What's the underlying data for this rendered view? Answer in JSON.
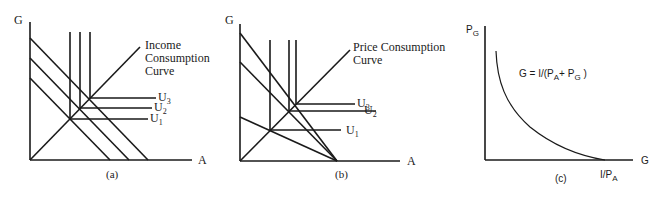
{
  "panels": [
    {
      "id": "a",
      "caption": "(a)",
      "y_axis_label": "G",
      "x_axis_label": "A",
      "curve_label_line1": "Income",
      "curve_label_line2": "Consumption",
      "curve_label_line3": "Curve",
      "indifference_labels": [
        {
          "base": "U",
          "sub": "3"
        },
        {
          "base": "U",
          "sub": "2"
        },
        {
          "base": "U",
          "sub": "1"
        }
      ]
    },
    {
      "id": "b",
      "caption": "(b)",
      "y_axis_label": "G",
      "x_axis_label": "A",
      "curve_label_line1": "Price Consumption",
      "curve_label_line2": "Curve",
      "indifference_labels": [
        {
          "base": "U",
          "sub": "3"
        },
        {
          "base": "U",
          "sub": "2"
        },
        {
          "base": "U",
          "sub": "1"
        }
      ]
    },
    {
      "id": "c",
      "caption": "(c)",
      "y_axis_label": {
        "base": "P",
        "sub": "G"
      },
      "x_axis_label": "G",
      "equation": {
        "part1": "G = I/(P",
        "sub1": "A",
        "part2": "+ P",
        "sub2": "G",
        "part3": " )"
      },
      "x_intercept_label": {
        "base": "I/P",
        "sub": "A"
      }
    }
  ]
}
